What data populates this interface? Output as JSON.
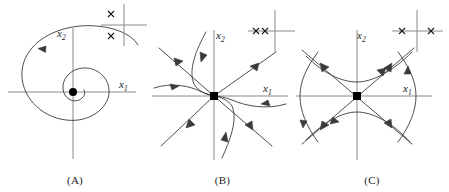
{
  "figure": {
    "background_color": "#ffffff",
    "curve_color": "#3a3a3a",
    "axis_color": "#8a8a8a",
    "marker_color": "#000000",
    "text_color": "#1a1a1a",
    "width": 449,
    "height": 192
  },
  "panels": [
    {
      "id": "A",
      "caption": "(A)",
      "portrait_type": "stable-spiral",
      "description": "Trajectory spirals inward counterclockwise toward the equilibrium at the origin",
      "equilibrium_marker": "filled-circle",
      "x_axis_label": "x",
      "x_axis_label_sub": "1",
      "y_axis_label": "x",
      "y_axis_label_sub": "2",
      "origin": {
        "x": 73,
        "y": 92
      },
      "x_axis": {
        "x1": 8,
        "x2": 136,
        "y": 92
      },
      "y_axis": {
        "x": 73,
        "y1": 28,
        "y2": 159
      },
      "inset": {
        "name": "eigenvalue-inset-A",
        "description": "Complex conjugate pair of eigenvalues with negative real part",
        "axis_origin": {
          "x": 124,
          "y": 25
        },
        "re_axis": {
          "x1": 101,
          "x2": 147,
          "y": 25
        },
        "im_axis": {
          "x": 124,
          "y1": 4,
          "y2": 46
        },
        "eigenvalues": [
          {
            "marker": "x",
            "re": -0.55,
            "im": 0.55
          },
          {
            "marker": "x",
            "re": -0.55,
            "im": -0.55
          }
        ]
      }
    },
    {
      "id": "B",
      "caption": "(B)",
      "portrait_type": "stable-node",
      "description": "All trajectories flow inward along straight and curved paths into the origin",
      "equilibrium_marker": "filled-square",
      "x_axis_label": "x",
      "x_axis_label_sub": "1",
      "y_axis_label": "x",
      "y_axis_label_sub": "2",
      "origin": {
        "x": 214,
        "y": 96
      },
      "x_axis": {
        "x1": 152,
        "x2": 288,
        "y": 96
      },
      "y_axis": {
        "x": 214,
        "y1": 30,
        "y2": 160
      },
      "inset": {
        "name": "eigenvalue-inset-B",
        "description": "Two real negative eigenvalues on the negative real axis",
        "axis_origin": {
          "x": 275,
          "y": 31
        },
        "re_axis": {
          "x1": 248,
          "x2": 296,
          "y": 31
        },
        "im_axis": {
          "x": 275,
          "y1": 10,
          "y2": 52
        },
        "eigenvalues": [
          {
            "marker": "x",
            "re": -0.75,
            "im": 0
          },
          {
            "marker": "x",
            "re": -0.45,
            "im": 0
          }
        ]
      }
    },
    {
      "id": "C",
      "caption": "(C)",
      "portrait_type": "saddle-point",
      "description": "Hyperbolic trajectories approach along the stable separatrix and leave along the unstable separatrix",
      "equilibrium_marker": "filled-square",
      "x_axis_label": "x",
      "x_axis_label_sub": "1",
      "y_axis_label": "x",
      "y_axis_label_sub": "2",
      "origin": {
        "x": 357,
        "y": 96
      },
      "x_axis": {
        "x1": 296,
        "x2": 432,
        "y": 96
      },
      "y_axis": {
        "x": 357,
        "y1": 30,
        "y2": 160
      },
      "inset": {
        "name": "eigenvalue-inset-C",
        "description": "One negative and one positive real eigenvalue",
        "axis_origin": {
          "x": 417,
          "y": 31
        },
        "re_axis": {
          "x1": 392,
          "x2": 443,
          "y": 31
        },
        "im_axis": {
          "x": 417,
          "y1": 10,
          "y2": 52
        },
        "eigenvalues": [
          {
            "marker": "x",
            "re": -0.6,
            "im": 0
          },
          {
            "marker": "x",
            "re": 0.6,
            "im": 0
          }
        ]
      }
    }
  ]
}
